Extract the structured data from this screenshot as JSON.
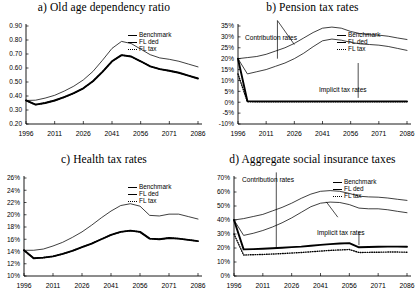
{
  "figure": {
    "panels": [
      {
        "id": "a",
        "title": "a) Old age dependency ratio",
        "legend": [
          "Benchmark",
          "FL ded",
          "FL tax"
        ],
        "annotations": []
      },
      {
        "id": "b",
        "title": "b) Pension tax rates",
        "legend": [
          "Benchmark",
          "FL ded",
          "FL tax"
        ],
        "annotations": [
          "Contribution rates",
          "Implicit tax rates"
        ]
      },
      {
        "id": "c",
        "title": "c) Health tax rates",
        "legend": [
          "Benchmark",
          "FL ded",
          "FL tax"
        ],
        "annotations": []
      },
      {
        "id": "d",
        "title": "d) Aggregate social insurance taxes",
        "legend": [
          "Benchmark",
          "FL ded",
          "FL tax"
        ],
        "annotations": [
          "Contribution rates",
          "Implicit tax rates"
        ]
      }
    ]
  },
  "chart_data": [
    {
      "type": "line",
      "title": "a) Old age dependency ratio",
      "xlabel": "",
      "ylabel": "",
      "xlim": [
        1996,
        2086
      ],
      "ylim": [
        0.2,
        0.9
      ],
      "xticks": [
        1996,
        2011,
        2026,
        2041,
        2056,
        2071,
        2086
      ],
      "yticks": [
        0.2,
        0.3,
        0.4,
        0.5,
        0.6,
        0.7,
        0.8,
        0.9
      ],
      "ytick_labels": [
        "0.20",
        "0.30",
        "0.40",
        "0.50",
        "0.60",
        "0.70",
        "0.80",
        "0.90"
      ],
      "grid": false,
      "legend_position": "top-right",
      "x": [
        1996,
        2001,
        2006,
        2011,
        2016,
        2021,
        2026,
        2031,
        2036,
        2041,
        2046,
        2051,
        2056,
        2061,
        2066,
        2071,
        2076,
        2081,
        2086
      ],
      "series": [
        {
          "name": "Benchmark",
          "values": [
            0.368,
            0.37,
            0.385,
            0.405,
            0.435,
            0.47,
            0.515,
            0.575,
            0.655,
            0.74,
            0.79,
            0.775,
            0.735,
            0.695,
            0.672,
            0.662,
            0.648,
            0.628,
            0.608
          ]
        },
        {
          "name": "FL ded",
          "values": [
            0.368,
            0.338,
            0.35,
            0.368,
            0.392,
            0.42,
            0.455,
            0.505,
            0.572,
            0.648,
            0.692,
            0.682,
            0.648,
            0.612,
            0.592,
            0.58,
            0.566,
            0.545,
            0.525
          ]
        },
        {
          "name": "FL tax",
          "values": [
            0.368,
            0.338,
            0.35,
            0.368,
            0.392,
            0.42,
            0.455,
            0.505,
            0.572,
            0.648,
            0.692,
            0.682,
            0.648,
            0.612,
            0.592,
            0.58,
            0.566,
            0.545,
            0.525
          ]
        }
      ]
    },
    {
      "type": "line",
      "title": "b) Pension tax rates",
      "xlabel": "",
      "ylabel": "",
      "xlim": [
        1996,
        2086
      ],
      "ylim": [
        -10,
        35
      ],
      "xticks": [
        1996,
        2011,
        2026,
        2041,
        2056,
        2071,
        2086
      ],
      "yticks": [
        -10,
        -5,
        0,
        5,
        10,
        15,
        20,
        25,
        30,
        35
      ],
      "ytick_labels": [
        "-10%",
        "-5%",
        "0%",
        "5%",
        "10%",
        "15%",
        "20%",
        "25%",
        "30%",
        "35%"
      ],
      "grid": false,
      "legend_position": "top-right",
      "annotations": [
        {
          "text": "Contribution rates",
          "x": 2014,
          "y": 36
        },
        {
          "text": "Implicit tax rates",
          "x": 2062,
          "y": 11
        }
      ],
      "x": [
        1996,
        2001,
        2006,
        2011,
        2016,
        2021,
        2026,
        2031,
        2036,
        2041,
        2046,
        2051,
        2056,
        2061,
        2066,
        2071,
        2076,
        2081,
        2086
      ],
      "series": [
        {
          "name": "Benchmark contribution",
          "values": [
            20.0,
            20.5,
            21.0,
            22.0,
            23.5,
            25.0,
            27.0,
            29.5,
            32.0,
            34.0,
            34.5,
            34.0,
            32.5,
            31.5,
            31.0,
            30.8,
            30.3,
            29.5,
            28.8
          ]
        },
        {
          "name": "FL ded contribution",
          "values": [
            20.0,
            13.0,
            14.0,
            15.0,
            16.5,
            18.0,
            20.0,
            22.5,
            25.5,
            28.2,
            29.0,
            28.5,
            27.5,
            26.8,
            26.5,
            26.2,
            25.6,
            24.7,
            23.8
          ]
        },
        {
          "name": "Benchmark implicit",
          "values": [
            20.0,
            0.5,
            0.4,
            0.4,
            0.4,
            0.4,
            0.4,
            0.4,
            0.4,
            0.4,
            0.4,
            0.4,
            0.4,
            0.4,
            0.4,
            0.4,
            0.4,
            0.4,
            0.4
          ]
        },
        {
          "name": "FL ded implicit",
          "values": [
            13.0,
            0.2,
            0.2,
            0.2,
            0.2,
            0.2,
            0.2,
            0.2,
            0.2,
            0.2,
            0.2,
            0.2,
            0.2,
            0.2,
            0.2,
            0.2,
            0.2,
            0.2,
            0.2
          ]
        }
      ]
    },
    {
      "type": "line",
      "title": "c) Health tax rates",
      "xlabel": "",
      "ylabel": "",
      "xlim": [
        1996,
        2086
      ],
      "ylim": [
        10,
        26
      ],
      "xticks": [
        1996,
        2011,
        2026,
        2041,
        2056,
        2071,
        2086
      ],
      "yticks": [
        10,
        12,
        14,
        16,
        18,
        20,
        22,
        24,
        26
      ],
      "ytick_labels": [
        "10%",
        "12%",
        "14%",
        "16%",
        "18%",
        "20%",
        "22%",
        "24%",
        "26%"
      ],
      "grid": false,
      "legend_position": "top-right",
      "x": [
        1996,
        2001,
        2006,
        2011,
        2016,
        2021,
        2026,
        2031,
        2036,
        2041,
        2046,
        2051,
        2056,
        2061,
        2066,
        2071,
        2076,
        2081,
        2086
      ],
      "series": [
        {
          "name": "Benchmark",
          "values": [
            14.2,
            14.2,
            14.4,
            14.9,
            15.5,
            16.3,
            17.2,
            18.3,
            19.5,
            20.6,
            21.5,
            21.8,
            21.4,
            19.9,
            19.8,
            20.1,
            20.1,
            19.7,
            19.3
          ]
        },
        {
          "name": "FL ded",
          "values": [
            14.2,
            12.9,
            13.0,
            13.2,
            13.6,
            14.1,
            14.7,
            15.3,
            16.0,
            16.7,
            17.2,
            17.4,
            17.2,
            16.1,
            16.0,
            16.2,
            16.1,
            15.9,
            15.7
          ]
        },
        {
          "name": "FL tax",
          "values": [
            14.2,
            12.9,
            13.0,
            13.2,
            13.6,
            14.1,
            14.7,
            15.3,
            16.0,
            16.7,
            17.2,
            17.4,
            17.2,
            16.1,
            16.0,
            16.2,
            16.1,
            15.9,
            15.7
          ]
        }
      ]
    },
    {
      "type": "line",
      "title": "d) Aggregate social insurance taxes",
      "xlabel": "",
      "ylabel": "",
      "xlim": [
        1996,
        2086
      ],
      "ylim": [
        0,
        70
      ],
      "xticks": [
        1996,
        2011,
        2026,
        2041,
        2056,
        2071,
        2086
      ],
      "yticks": [
        0,
        10,
        20,
        30,
        40,
        50,
        60,
        70
      ],
      "ytick_labels": [
        "0%",
        "10%",
        "20%",
        "30%",
        "40%",
        "50%",
        "60%",
        "70%"
      ],
      "grid": false,
      "legend_position": "top-right",
      "annotations": [
        {
          "text": "Contribution rates",
          "x": 2014,
          "y": 72
        },
        {
          "text": "Implicit tax rates",
          "x": 2055,
          "y": 30
        }
      ],
      "x": [
        1996,
        2001,
        2006,
        2011,
        2016,
        2021,
        2026,
        2031,
        2036,
        2041,
        2046,
        2051,
        2056,
        2061,
        2066,
        2071,
        2076,
        2081,
        2086
      ],
      "series": [
        {
          "name": "Benchmark contribution",
          "values": [
            40.0,
            41.0,
            42.5,
            44.0,
            46.5,
            49.0,
            52.0,
            55.5,
            58.5,
            60.5,
            61.0,
            60.5,
            59.0,
            57.0,
            56.5,
            56.3,
            55.7,
            54.8,
            54.0
          ]
        },
        {
          "name": "FL ded contribution",
          "values": [
            40.0,
            29.0,
            30.5,
            32.5,
            35.0,
            38.0,
            41.5,
            45.5,
            49.5,
            52.0,
            52.8,
            52.5,
            51.0,
            48.5,
            48.0,
            48.0,
            47.3,
            46.2,
            45.2
          ]
        },
        {
          "name": "Benchmark implicit",
          "values": [
            40.0,
            19.0,
            19.2,
            19.5,
            19.8,
            20.2,
            20.6,
            21.0,
            21.6,
            22.2,
            22.8,
            23.2,
            23.5,
            20.5,
            20.7,
            20.9,
            21.0,
            21.0,
            20.9
          ]
        },
        {
          "name": "FL ded implicit",
          "values": [
            30.0,
            15.0,
            15.2,
            15.4,
            15.7,
            16.0,
            16.4,
            16.8,
            17.3,
            17.8,
            18.3,
            18.6,
            18.9,
            16.8,
            16.9,
            17.0,
            17.1,
            17.1,
            17.0
          ]
        }
      ]
    }
  ]
}
